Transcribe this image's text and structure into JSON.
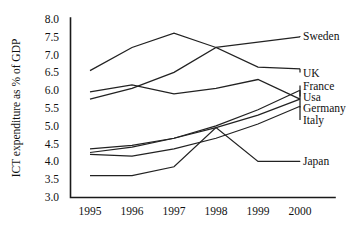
{
  "chart_data": {
    "type": "line",
    "title": "",
    "xlabel": "",
    "ylabel": "ICT expenditure as % of GDP",
    "categories": [
      "1995",
      "1996",
      "1997",
      "1998",
      "1999",
      "2000"
    ],
    "x": [
      1995,
      1996,
      1997,
      1998,
      1999,
      2000
    ],
    "ylim": [
      3.0,
      8.0
    ],
    "xlim": [
      1995,
      2000
    ],
    "yticks": [
      "8.0",
      "7.5",
      "7.0",
      "6.5",
      "6.0",
      "5.5",
      "5.0",
      "4.5",
      "4.0",
      "3.5",
      "3.0"
    ],
    "ytick_values": [
      8.0,
      7.5,
      7.0,
      6.5,
      6.0,
      5.5,
      5.0,
      4.5,
      4.0,
      3.5,
      3.0
    ],
    "ytick_step": 0.5,
    "grid": false,
    "legend_position": "right-inline-labels",
    "series": [
      {
        "name": "Sweden",
        "values": [
          6.55,
          7.2,
          7.6,
          7.2,
          7.35,
          7.5
        ]
      },
      {
        "name": "UK",
        "values": [
          5.75,
          6.05,
          6.5,
          7.2,
          6.65,
          6.6
        ]
      },
      {
        "name": "France",
        "values": [
          5.95,
          6.15,
          5.9,
          6.05,
          6.3,
          5.75
        ]
      },
      {
        "name": "Usa",
        "values": [
          4.35,
          4.45,
          4.65,
          5.0,
          5.45,
          6.0
        ]
      },
      {
        "name": "Germany",
        "values": [
          4.25,
          4.4,
          4.65,
          4.95,
          5.3,
          5.75
        ]
      },
      {
        "name": "Italy",
        "values": [
          4.2,
          4.15,
          4.35,
          4.65,
          5.05,
          5.55
        ]
      },
      {
        "name": "Japan",
        "values": [
          3.6,
          3.6,
          3.85,
          4.95,
          4.0,
          4.0
        ]
      }
    ]
  },
  "axis": {
    "y_title": "ICT expenditure as % of GDP"
  },
  "labels": {
    "sweden": "Sweden",
    "uk": "UK",
    "france": "France",
    "usa": "Usa",
    "germany": "Germany",
    "italy": "Italy",
    "japan": "Japan"
  },
  "ticks": {
    "y": [
      "8.0",
      "7.5",
      "7.0",
      "6.5",
      "6.0",
      "5.5",
      "5.0",
      "4.5",
      "4.0",
      "3.5",
      "3.0"
    ],
    "x": [
      "1995",
      "1996",
      "1997",
      "1998",
      "1999",
      "2000"
    ]
  },
  "colors": {
    "line": "#222222",
    "axis": "#1a1a1a",
    "text": "#111111",
    "background": "#ffffff"
  }
}
